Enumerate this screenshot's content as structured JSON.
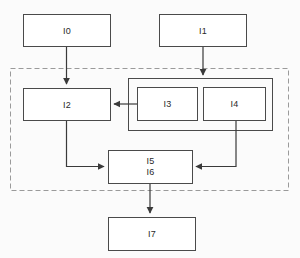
{
  "diagram": {
    "background_color": "#fbfbfb",
    "box_fill": "#ffffff",
    "box_stroke": "#4a4a4a",
    "connector_color": "#3a3a3a",
    "boundary_color": "#9a9a9a",
    "boundary_style": "dashed",
    "nodes": [
      {
        "id": "I0",
        "label": "I0",
        "x": 23,
        "y": 14,
        "w": 87,
        "h": 32,
        "inside_boundary": false
      },
      {
        "id": "I1",
        "label": "I1",
        "x": 159,
        "y": 14,
        "w": 87,
        "h": 32,
        "inside_boundary": false
      },
      {
        "id": "I2",
        "label": "I2",
        "x": 23,
        "y": 88,
        "w": 87,
        "h": 32,
        "inside_boundary": true
      },
      {
        "id": "I3",
        "label": "I3",
        "x": 137,
        "y": 87,
        "w": 60,
        "h": 33,
        "inside_boundary": true
      },
      {
        "id": "I4",
        "label": "I4",
        "x": 203,
        "y": 87,
        "w": 62,
        "h": 33,
        "inside_boundary": true
      },
      {
        "id": "I5I6",
        "label_line1": "I5",
        "label_line2": "I6",
        "x": 108,
        "y": 150,
        "w": 84,
        "h": 33,
        "inside_boundary": true
      },
      {
        "id": "I7",
        "label": "I7",
        "x": 108,
        "y": 217,
        "w": 87,
        "h": 33,
        "inside_boundary": false
      }
    ],
    "group_container": {
      "id": "I3-I4-group",
      "x": 128,
      "y": 78,
      "w": 144,
      "h": 52
    },
    "boundary": {
      "x": 10,
      "y": 68,
      "w": 278,
      "h": 122
    },
    "edges": [
      {
        "from": "I0",
        "to": "I2",
        "label": ""
      },
      {
        "from": "I1",
        "to": "I3-I4-group",
        "label": ""
      },
      {
        "from": "I3",
        "to": "I2",
        "label": ""
      },
      {
        "from": "I2",
        "to": "I5I6",
        "label": ""
      },
      {
        "from": "I4",
        "to": "I5I6",
        "label": ""
      },
      {
        "from": "I5I6",
        "to": "I7",
        "label": ""
      }
    ]
  }
}
